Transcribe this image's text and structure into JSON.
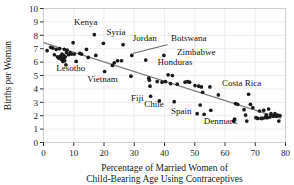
{
  "chart_data": {
    "type": "scatter",
    "title": "",
    "xlabel": "Percentage of Married Women of Child-Bearing Age Using Contraceptives",
    "xlabel_line1": "Percentage of Married Women of",
    "xlabel_line2": "Child-Bearing Age Using Contraceptives",
    "ylabel": "Births per Woman",
    "xlim": [
      0,
      80
    ],
    "ylim": [
      0,
      10
    ],
    "xticks": [
      0,
      10,
      20,
      30,
      40,
      50,
      60,
      70,
      80
    ],
    "yticks": [
      0,
      1,
      2,
      3,
      4,
      5,
      6,
      7,
      8,
      9,
      10
    ],
    "xtick_labels": [
      "0",
      "10",
      "20",
      "30",
      "40",
      "50",
      "60",
      "70",
      "80"
    ],
    "ytick_labels": [
      "0",
      "1",
      "2",
      "3",
      "4",
      "5",
      "6",
      "7",
      "8",
      "9",
      "10"
    ],
    "grid": true,
    "grid_axis": "y",
    "legend": "none",
    "marker_color": "#1a1a1a",
    "trendline_color": "#808080",
    "grid_color": "#e6e6e6",
    "frame_color": "#cccccc",
    "trendline": {
      "x0": 0,
      "y0": 7.45,
      "x1": 78.5,
      "y1": 1.8
    },
    "points": [
      {
        "x": 1.2,
        "y": 6.85
      },
      {
        "x": 2.4,
        "y": 7.1
      },
      {
        "x": 3.1,
        "y": 7.05
      },
      {
        "x": 3.6,
        "y": 6.55
      },
      {
        "x": 4.2,
        "y": 6.95
      },
      {
        "x": 4.6,
        "y": 6.4
      },
      {
        "x": 5.0,
        "y": 6.3
      },
      {
        "x": 5.3,
        "y": 7.0
      },
      {
        "x": 5.6,
        "y": 6.45
      },
      {
        "x": 5.9,
        "y": 6.2
      },
      {
        "x": 6.1,
        "y": 6.6
      },
      {
        "x": 6.3,
        "y": 6.3
      },
      {
        "x": 6.4,
        "y": 6.05
      },
      {
        "x": 6.6,
        "y": 6.5
      },
      {
        "x": 6.8,
        "y": 6.25
      },
      {
        "x": 6.9,
        "y": 6.95
      },
      {
        "x": 7.0,
        "y": 6.1
      },
      {
        "x": 7.2,
        "y": 6.4
      },
      {
        "x": 7.4,
        "y": 5.8
      },
      {
        "x": 7.6,
        "y": 6.7
      },
      {
        "x": 7.8,
        "y": 6.9
      },
      {
        "x": 8.3,
        "y": 6.55
      },
      {
        "x": 8.8,
        "y": 6.7
      },
      {
        "x": 9.3,
        "y": 6.6
      },
      {
        "x": 9.8,
        "y": 7.45
      },
      {
        "x": 10.2,
        "y": 6.6
      },
      {
        "x": 10.8,
        "y": 6.05
      },
      {
        "x": 12.0,
        "y": 6.65
      },
      {
        "x": 12.6,
        "y": 6.6
      },
      {
        "x": 14.2,
        "y": 6.95
      },
      {
        "x": 14.8,
        "y": 6.35
      },
      {
        "x": 16.8,
        "y": 8.05
      },
      {
        "x": 17.3,
        "y": 6.5
      },
      {
        "x": 19.8,
        "y": 7.4
      },
      {
        "x": 20.2,
        "y": 5.3
      },
      {
        "x": 22.8,
        "y": 5.75
      },
      {
        "x": 23.4,
        "y": 5.95
      },
      {
        "x": 24.5,
        "y": 6.1
      },
      {
        "x": 25.8,
        "y": 6.1
      },
      {
        "x": 26.3,
        "y": 7.3
      },
      {
        "x": 28.9,
        "y": 4.95
      },
      {
        "x": 29.2,
        "y": 6.5
      },
      {
        "x": 33.8,
        "y": 6.15
      },
      {
        "x": 34.8,
        "y": 4.8
      },
      {
        "x": 35.0,
        "y": 4.65
      },
      {
        "x": 35.2,
        "y": 4.2
      },
      {
        "x": 35.4,
        "y": 3.45
      },
      {
        "x": 37.6,
        "y": 4.55
      },
      {
        "x": 38.3,
        "y": 3.1
      },
      {
        "x": 39.2,
        "y": 4.5
      },
      {
        "x": 39.8,
        "y": 6.5
      },
      {
        "x": 40.3,
        "y": 4.55
      },
      {
        "x": 41.2,
        "y": 5.05
      },
      {
        "x": 42.0,
        "y": 4.4
      },
      {
        "x": 42.6,
        "y": 5.0
      },
      {
        "x": 43.2,
        "y": 3.05
      },
      {
        "x": 44.2,
        "y": 4.35
      },
      {
        "x": 46.8,
        "y": 4.5
      },
      {
        "x": 47.6,
        "y": 4.55
      },
      {
        "x": 48.3,
        "y": 4.5
      },
      {
        "x": 50.1,
        "y": 4.25
      },
      {
        "x": 50.8,
        "y": 2.15
      },
      {
        "x": 51.3,
        "y": 4.2
      },
      {
        "x": 51.8,
        "y": 2.8
      },
      {
        "x": 52.2,
        "y": 4.15
      },
      {
        "x": 52.6,
        "y": 3.75
      },
      {
        "x": 53.1,
        "y": 2.1
      },
      {
        "x": 55.0,
        "y": 4.15
      },
      {
        "x": 55.3,
        "y": 2.4
      },
      {
        "x": 57.8,
        "y": 3.55
      },
      {
        "x": 62.8,
        "y": 1.6
      },
      {
        "x": 63.2,
        "y": 1.75
      },
      {
        "x": 63.5,
        "y": 2.9
      },
      {
        "x": 64.2,
        "y": 2.85
      },
      {
        "x": 66.3,
        "y": 2.45
      },
      {
        "x": 66.8,
        "y": 2.05
      },
      {
        "x": 67.2,
        "y": 1.6
      },
      {
        "x": 67.8,
        "y": 3.6
      },
      {
        "x": 68.4,
        "y": 2.85
      },
      {
        "x": 69.2,
        "y": 2.6
      },
      {
        "x": 70.2,
        "y": 1.85
      },
      {
        "x": 70.8,
        "y": 1.8
      },
      {
        "x": 71.4,
        "y": 2.35
      },
      {
        "x": 71.9,
        "y": 1.8
      },
      {
        "x": 72.3,
        "y": 1.8
      },
      {
        "x": 72.8,
        "y": 2.4
      },
      {
        "x": 73.2,
        "y": 1.85
      },
      {
        "x": 73.6,
        "y": 2.05
      },
      {
        "x": 74.0,
        "y": 1.85
      },
      {
        "x": 74.4,
        "y": 2.5
      },
      {
        "x": 74.8,
        "y": 1.9
      },
      {
        "x": 75.2,
        "y": 2.15
      },
      {
        "x": 75.6,
        "y": 2.0
      },
      {
        "x": 76.0,
        "y": 1.95
      },
      {
        "x": 76.5,
        "y": 2.15
      },
      {
        "x": 77.0,
        "y": 1.95
      },
      {
        "x": 77.4,
        "y": 2.05
      },
      {
        "x": 77.8,
        "y": 1.6
      },
      {
        "x": 78.2,
        "y": 2.0
      }
    ],
    "annotations": [
      {
        "name": "kenya",
        "text": "Kenya",
        "x": 14.0,
        "y": 8.75,
        "anchor": "middle"
      },
      {
        "name": "syria",
        "text": "Syria",
        "x": 24.0,
        "y": 8.05,
        "anchor": "middle"
      },
      {
        "name": "jordan",
        "text": "Jordan",
        "x": 33.5,
        "y": 7.6,
        "anchor": "middle"
      },
      {
        "name": "botswana",
        "text": "Botswana",
        "x": 48.0,
        "y": 7.55,
        "anchor": "middle"
      },
      {
        "name": "zimbabwe",
        "text": "Zimbabwe",
        "x": 50.5,
        "y": 6.5,
        "anchor": "middle"
      },
      {
        "name": "honduras",
        "text": "Honduras",
        "x": 43.5,
        "y": 5.75,
        "anchor": "middle"
      },
      {
        "name": "lesotho",
        "text": "Lesotho",
        "x": 9.0,
        "y": 5.35,
        "anchor": "middle"
      },
      {
        "name": "vietnam",
        "text": "Vietnam",
        "x": 19.5,
        "y": 4.55,
        "anchor": "middle"
      },
      {
        "name": "costa-rica",
        "text": "Costa Rica",
        "x": 65.5,
        "y": 4.2,
        "anchor": "middle"
      },
      {
        "name": "fiji",
        "text": "Fiji",
        "x": 31.0,
        "y": 3.1,
        "anchor": "middle"
      },
      {
        "name": "chile",
        "text": "Chile",
        "x": 36.5,
        "y": 2.65,
        "anchor": "middle"
      },
      {
        "name": "spain",
        "text": "Spain",
        "x": 45.5,
        "y": 2.15,
        "anchor": "middle"
      },
      {
        "name": "denmark",
        "text": "Denmark",
        "x": 58.5,
        "y": 1.35,
        "anchor": "middle"
      }
    ],
    "leader_lines": [
      {
        "name": "botswana-leader",
        "x0": 41.0,
        "y0": 7.3,
        "x1": 29.6,
        "y1": 6.65
      }
    ]
  }
}
